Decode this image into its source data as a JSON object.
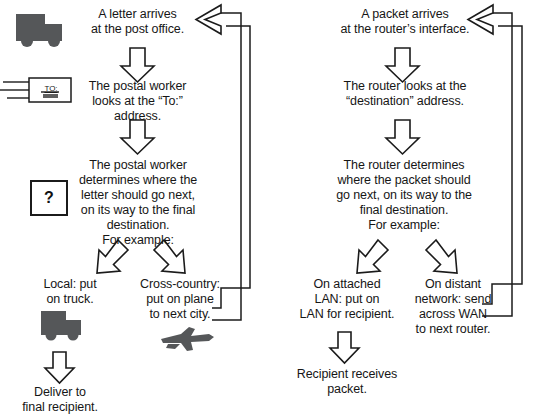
{
  "diagram": {
    "columns": [
      {
        "id": "postal",
        "steps": {
          "start": "A letter arrives\nat the post office.",
          "inspect": "The postal worker\nlooks at the “To:”\naddress.",
          "decide": "The postal worker\ndetermines where the\nletter should go next,\non its way to the final\ndestination.\nFor example:",
          "branch_left": "Local: put\non truck.",
          "branch_right": "Cross-country:\nput on plane\nto next city.",
          "terminal": "Deliver to\nfinal recipient."
        },
        "icons": {
          "start_icon_label": "truck-icon",
          "inspect_icon_label": "envelope-icon",
          "envelope_text": "TO:",
          "decide_icon_label": "question-box-icon",
          "question_mark": "?",
          "branch_left_icon_label": "truck-icon",
          "branch_right_icon_label": "airplane-icon"
        }
      },
      {
        "id": "router",
        "steps": {
          "start": "A packet arrives\nat the router’s interface.",
          "inspect": "The router looks at the\n“destination” address.",
          "decide": "The router determines\nwhere the packet should\ngo next, on its way to the\nfinal destination.\nFor example:",
          "branch_left": "On attached\nLAN: put on\nLAN for recipient.",
          "branch_right": "On distant\nnetwork: send\nacross WAN\nto next router.",
          "terminal": "Recipient receives\npacket."
        }
      }
    ],
    "colors": {
      "icon_fill": "#555759",
      "stroke": "#1b1b1b",
      "text": "#161616",
      "background": "#ffffff"
    }
  }
}
